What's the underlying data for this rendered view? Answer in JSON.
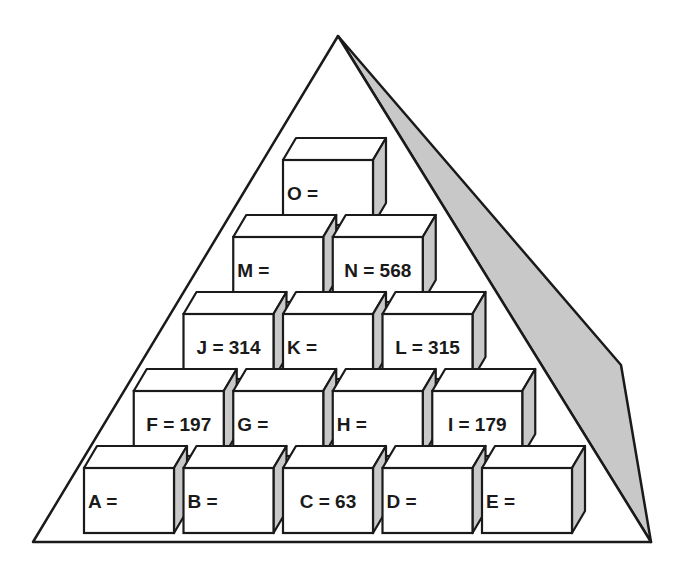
{
  "diagram": {
    "type": "number-pyramid",
    "colors": {
      "stroke": "#1a1a1a",
      "face": "#ffffff",
      "shade": "#c8c8c8"
    },
    "rows": [
      {
        "blocks": [
          {
            "id": "O",
            "text": "O =",
            "value": null
          }
        ]
      },
      {
        "blocks": [
          {
            "id": "M",
            "text": "M =",
            "value": null
          },
          {
            "id": "N",
            "text": "N = 568",
            "value": 568
          }
        ]
      },
      {
        "blocks": [
          {
            "id": "J",
            "text": "J = 314",
            "value": 314
          },
          {
            "id": "K",
            "text": "K =",
            "value": null
          },
          {
            "id": "L",
            "text": "L = 315",
            "value": 315
          }
        ]
      },
      {
        "blocks": [
          {
            "id": "F",
            "text": "F = 197",
            "value": 197
          },
          {
            "id": "G",
            "text": "G =",
            "value": null
          },
          {
            "id": "H",
            "text": "H =",
            "value": null
          },
          {
            "id": "I",
            "text": "I = 179",
            "value": 179
          }
        ]
      },
      {
        "blocks": [
          {
            "id": "A",
            "text": "A =",
            "value": null
          },
          {
            "id": "B",
            "text": "B =",
            "value": null
          },
          {
            "id": "C",
            "text": "C = 63",
            "value": 63
          },
          {
            "id": "D",
            "text": "D =",
            "value": null
          },
          {
            "id": "E",
            "text": "E =",
            "value": null
          }
        ]
      }
    ]
  }
}
